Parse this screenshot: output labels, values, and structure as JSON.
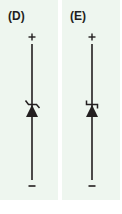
{
  "panels": [
    {
      "label": "(D)",
      "symbol": "zener-diode",
      "plus_sign": "+",
      "minus_sign": "−",
      "stroke_color": "#231f20"
    },
    {
      "label": "(E)",
      "symbol": "schottky-diode",
      "plus_sign": "+",
      "minus_sign": "−",
      "stroke_color": "#231f20"
    }
  ],
  "colors": {
    "panel_background": "#eef6ef",
    "page_background": "#ffffff",
    "ink": "#231f20"
  }
}
